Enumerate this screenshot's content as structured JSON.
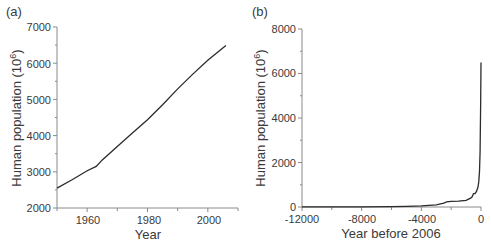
{
  "chart_data": [
    {
      "panel": "(a)",
      "type": "line",
      "title": "",
      "xlabel": "Year",
      "ylabel": "Human population (10^6)",
      "xlim": [
        1950,
        2010
      ],
      "ylim": [
        2000,
        7000
      ],
      "xticks": [
        1960,
        1980,
        2000
      ],
      "xminor": [
        1950,
        1970,
        1990,
        2010
      ],
      "yticks": [
        2000,
        3000,
        4000,
        5000,
        6000,
        7000
      ],
      "yminor": [
        2500,
        3500,
        4500,
        5500,
        6500
      ],
      "grid": false,
      "legend": null,
      "series": [
        {
          "name": "World population",
          "x": [
            1950,
            1955,
            1960,
            1963,
            1965,
            1970,
            1975,
            1980,
            1985,
            1990,
            1995,
            2000,
            2006
          ],
          "y": [
            2550,
            2780,
            3030,
            3150,
            3330,
            3700,
            4070,
            4440,
            4850,
            5290,
            5700,
            6080,
            6490
          ]
        }
      ]
    },
    {
      "panel": "(b)",
      "type": "line",
      "title": "",
      "xlabel": "Year before 2006",
      "ylabel": "Human population (10^6)",
      "xlim": [
        -12000,
        0
      ],
      "ylim": [
        0,
        8000
      ],
      "xticks": [
        -12000,
        -8000,
        -4000,
        0
      ],
      "xminor": [
        -10000,
        -6000,
        -2000
      ],
      "yticks": [
        0,
        2000,
        4000,
        6000,
        8000
      ],
      "yminor": [
        1000,
        3000,
        5000,
        7000
      ],
      "grid": false,
      "legend": null,
      "series": [
        {
          "name": "World population",
          "x": [
            -12000,
            -10000,
            -8000,
            -6000,
            -5000,
            -4000,
            -3500,
            -3000,
            -2500,
            -2300,
            -2000,
            -1500,
            -1000,
            -700,
            -600,
            -500,
            -400,
            -300,
            -200,
            -150,
            -100,
            -60,
            -40,
            -20,
            0
          ],
          "y": [
            4,
            5,
            10,
            20,
            30,
            50,
            70,
            100,
            170,
            230,
            250,
            260,
            300,
            400,
            450,
            600,
            600,
            700,
            900,
            1150,
            1600,
            2500,
            3700,
            4800,
            6500
          ]
        }
      ]
    }
  ],
  "panels": {
    "a": {
      "label": "(a)",
      "xlabel": "Year",
      "ylabel_main": "Human population (10",
      "ylabel_sup": "6",
      "ylabel_end": ")",
      "xtick_labels": [
        "1960",
        "1980",
        "2000"
      ],
      "ytick_labels": [
        "2000",
        "3000",
        "4000",
        "5000",
        "6000",
        "7000"
      ]
    },
    "b": {
      "label": "(b)",
      "xlabel": "Year before 2006",
      "ylabel_main": "Human population (10",
      "ylabel_sup": "6",
      "ylabel_end": ")",
      "xtick_labels": [
        "-12000",
        "-8000",
        "-4000",
        "0"
      ],
      "ytick_labels": [
        "0",
        "2000",
        "4000",
        "6000",
        "8000"
      ]
    }
  }
}
